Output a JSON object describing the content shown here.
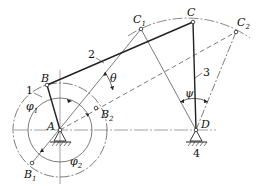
{
  "diagram": {
    "points": {
      "A": {
        "label": "A",
        "x": 60,
        "y": 130
      },
      "B": {
        "label": "B",
        "x": 47,
        "y": 85
      },
      "B1": {
        "label": "B",
        "sub": "1",
        "x": 32,
        "y": 163
      },
      "B2": {
        "label": "B",
        "sub": "2",
        "x": 96,
        "y": 108
      },
      "C": {
        "label": "C",
        "x": 193,
        "y": 22
      },
      "C1": {
        "label": "C",
        "sub": "1",
        "x": 141,
        "y": 29
      },
      "C2": {
        "label": "C",
        "sub": "2",
        "x": 236,
        "y": 32
      },
      "D": {
        "label": "D",
        "x": 196,
        "y": 130
      }
    },
    "links": [
      {
        "id": "1",
        "label": "1",
        "name": "crank AB"
      },
      {
        "id": "2",
        "label": "2",
        "name": "coupler BC"
      },
      {
        "id": "3",
        "label": "3",
        "name": "rocker CD"
      },
      {
        "id": "4",
        "label": "4",
        "name": "frame AD"
      }
    ],
    "angles": {
      "theta": "θ",
      "psi": "ψ",
      "phi1": {
        "label": "φ",
        "sub": "1"
      },
      "phi2": {
        "label": "φ",
        "sub": "2"
      }
    },
    "circles": {
      "crank_path_radius": 47,
      "inner_radius": 32,
      "rocker_arc_radius": 108
    },
    "colors": {
      "line": "#222222",
      "thin": "#555555",
      "background": "#ffffff"
    }
  }
}
